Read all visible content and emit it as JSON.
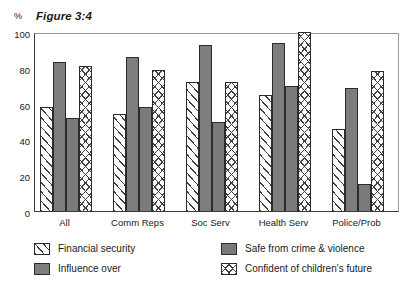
{
  "figure": {
    "title": "Figure 3:4",
    "axis_unit": "%"
  },
  "chart_data": {
    "type": "bar",
    "title": "Figure 3:4",
    "xlabel": "",
    "ylabel": "%",
    "ylim": [
      0,
      100
    ],
    "yticks": [
      0,
      20,
      40,
      60,
      80,
      100
    ],
    "ytick_labels": [
      "0",
      "20",
      "40",
      "60",
      "80",
      "100"
    ],
    "grid": false,
    "legend_position": "below",
    "categories": [
      "All",
      "Comm Reps",
      "Soc Serv",
      "Health Serv",
      "Police/Prob"
    ],
    "series": [
      {
        "name": "Financial security",
        "pattern": "diagonal-hatch",
        "color": "#fbfbfb",
        "values": [
          58,
          54,
          72,
          65,
          46
        ]
      },
      {
        "name": "Influence over",
        "pattern": "solid-gray",
        "color": "#7d7d7d",
        "values": [
          83,
          86,
          93,
          94,
          69
        ]
      },
      {
        "name": "Safe from crime & violence",
        "pattern": "solid-gray",
        "color": "#7a7a7a",
        "values": [
          52,
          58,
          50,
          70,
          15
        ]
      },
      {
        "name": "Confident of children's future",
        "pattern": "cross-hatch",
        "color": "#fbfbfb",
        "values": [
          81,
          79,
          72,
          100,
          78
        ]
      }
    ]
  }
}
